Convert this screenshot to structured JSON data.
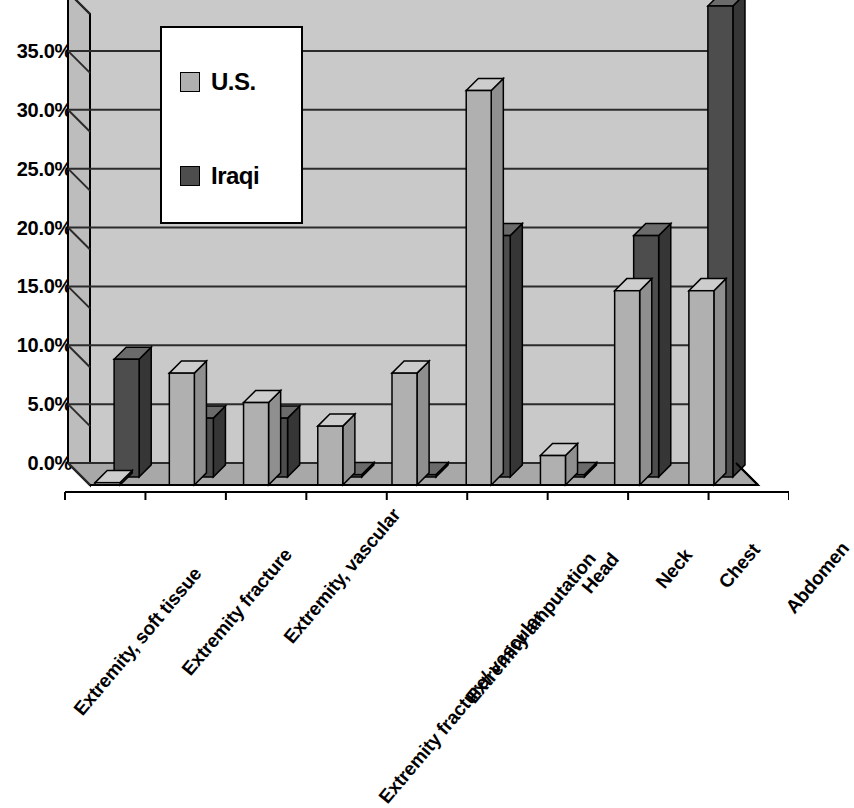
{
  "chart_data": {
    "type": "bar",
    "title": "",
    "subtitle": "",
    "xlabel": "",
    "ylabel": "",
    "grid": true,
    "legend_position": "inside-top-left",
    "style": "3d-clustered-column",
    "ylim": [
      0,
      40
    ],
    "ytick_step": 5,
    "ytick_labels": [
      "0.0%",
      "5.0%",
      "10.0%",
      "15.0%",
      "20.0%",
      "25.0%",
      "30.0%",
      "35.0%",
      "40.0%"
    ],
    "ytick_values": [
      0,
      5,
      10,
      15,
      20,
      25,
      30,
      35,
      40
    ],
    "categories": [
      "Extremity, soft tissue",
      "Extremity fracture",
      "Extremity, vascular",
      "Extremity fracture/ vascular",
      "Extremity amputation",
      "Head",
      "Neck",
      "Chest",
      "Abdomen"
    ],
    "series": [
      {
        "name": "U.S.",
        "color": "#b0b0b0",
        "values": [
          0.2,
          9.5,
          7.0,
          5.0,
          9.5,
          33.5,
          2.5,
          16.5,
          16.5
        ]
      },
      {
        "name": "Iraqi",
        "color": "#4d4d4d",
        "values": [
          10.0,
          5.0,
          5.0,
          0.2,
          0.2,
          20.5,
          0.2,
          20.5,
          40.0
        ]
      }
    ]
  },
  "legend": {
    "entries": [
      {
        "label": "U.S."
      },
      {
        "label": "Iraqi"
      }
    ]
  },
  "colors": {
    "plot_face": "#c9c9c9",
    "plot_side": "#bdbdbd",
    "plot_floor": "#a8a8a8",
    "gridline": "#2b2b2b",
    "axis": "#000000",
    "us_bar": "#b0b0b0",
    "us_bar_top": "#cdcdcd",
    "us_bar_side": "#8f8f8f",
    "iraqi_bar": "#4d4d4d",
    "iraqi_bar_top": "#6b6b6b",
    "iraqi_bar_side": "#363636",
    "background": "#ffffff"
  }
}
